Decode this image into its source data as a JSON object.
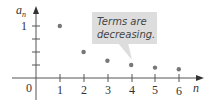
{
  "chart_data": {
    "type": "scatter",
    "title": "",
    "xlabel": "n",
    "ylabel": "a_n",
    "ylabel_main": "a",
    "ylabel_sub": "n",
    "x": [
      1,
      2,
      3,
      4,
      5,
      6
    ],
    "values": [
      1,
      0.5,
      0.3333,
      0.25,
      0.2,
      0.1667
    ],
    "x_ticks": [
      "1",
      "2",
      "3",
      "4",
      "5",
      "6"
    ],
    "y_ticks": [
      "1"
    ],
    "origin_label": "0",
    "xlim": [
      0,
      6.5
    ],
    "ylim": [
      0,
      1.2
    ],
    "grid": false,
    "annotation": {
      "line1": "Terms are",
      "line2": "decreasing.",
      "points_to": 4
    },
    "colors": {
      "axis": "#555555",
      "point": "#777777",
      "callout_fill": "#dddddd"
    }
  }
}
